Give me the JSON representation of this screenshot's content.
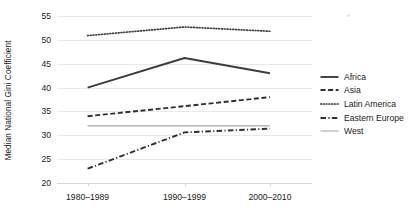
{
  "chart_data": {
    "type": "line",
    "title": "",
    "xlabel": "",
    "ylabel": "Median National Gini Coefficient",
    "categories": [
      "1980–1989",
      "1990–1999",
      "2000–2010"
    ],
    "ylim": [
      20,
      55
    ],
    "yticks": [
      20,
      25,
      30,
      35,
      40,
      45,
      50,
      55
    ],
    "grid": true,
    "legend_position": "right",
    "series": [
      {
        "name": "Africa",
        "values": [
          40.0,
          46.2,
          43.0
        ],
        "style": "solid",
        "color": "#3c3c46"
      },
      {
        "name": "Asia",
        "values": [
          34.0,
          36.1,
          38.0
        ],
        "style": "dashed",
        "color": "#2f2f38"
      },
      {
        "name": "Latin America",
        "values": [
          50.9,
          52.7,
          51.8
        ],
        "style": "dotted",
        "color": "#3c3c46"
      },
      {
        "name": "Eastern Europe",
        "values": [
          23.0,
          30.6,
          31.4
        ],
        "style": "dashdot",
        "color": "#2f2f38"
      },
      {
        "name": "West",
        "values": [
          32.0,
          32.0,
          32.0
        ],
        "style": "solid-light",
        "color": "#b4b4bb"
      }
    ]
  },
  "legend": {
    "items": [
      {
        "label": "Africa"
      },
      {
        "label": "Asia"
      },
      {
        "label": "Latin America"
      },
      {
        "label": "Eastern Europe"
      },
      {
        "label": "West"
      }
    ]
  }
}
